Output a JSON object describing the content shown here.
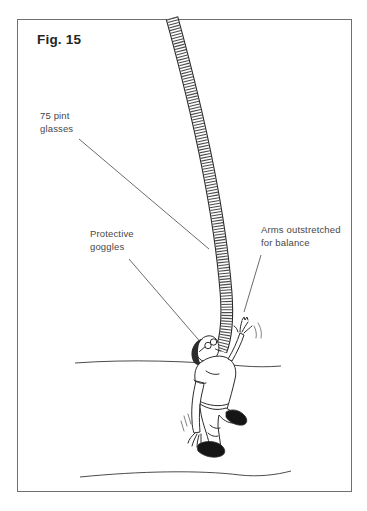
{
  "figure": {
    "caption": "Fig. 15",
    "labels": {
      "glasses": {
        "line1": "75 pint",
        "line2": "glasses"
      },
      "goggles": {
        "line1": "Protective",
        "line2": "goggles"
      },
      "arms": {
        "line1": "Arms outstretched",
        "line2": "for balance"
      }
    },
    "colors": {
      "ink": "#2b2b2b",
      "frame_border": "#6f6f6f",
      "label_text": "#474747",
      "caption_text": "#242424",
      "shoe_fill": "#151515",
      "stack_hatch": "#3d3d3d",
      "leader": "#5a5a5a",
      "background": "#ffffff"
    }
  }
}
